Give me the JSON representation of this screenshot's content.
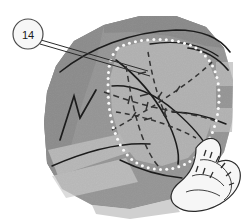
{
  "figure": {
    "type": "geological-sketch-map",
    "background_color": "#ffffff",
    "width": 242,
    "height": 223
  },
  "callout": {
    "label": "14",
    "name": "callout-marker-14",
    "circle": {
      "cx": 28,
      "cy": 34,
      "r": 15
    },
    "circle_fill": "#f7f7f7",
    "circle_stroke": "#4a4a4a",
    "leader_lines": [
      {
        "x1": 41,
        "y1": 40,
        "x2": 148,
        "y2": 71
      },
      {
        "x1": 40,
        "y1": 44,
        "x2": 150,
        "y2": 76
      }
    ],
    "leader_stroke": "#2b2b2b"
  },
  "palette": {
    "outer_massif": "#8f8f8f",
    "outer_massif_dark": "#7c7c7c",
    "slope_shadow": "#6e6e6e",
    "inner_zone": "#c9c9c9",
    "light_band": "#cfcfcf",
    "pale_band": "#d9d9d9",
    "white_lobe": "#f4f4f4",
    "lineament": "#1c1c1c",
    "dashed_fault": "#333333",
    "dot_boundary": "#fafafa",
    "hatch": "#2a2a2a"
  },
  "regions": [
    {
      "name": "outer-massif-polygon",
      "description": "Main angular rock massif body",
      "fill": "#8f8f8f",
      "points": "56,66 74,41 104,25 140,16 176,16 206,27 224,48 233,80 232,122 224,152 206,178 172,199 130,209 92,205 62,189 47,163 44,122 47,92"
    },
    {
      "name": "massif-shadow-left",
      "description": "Darker shaded left flank",
      "fill": "#7b7b7b",
      "points": "56,66 74,41 104,25 96,62 82,104 70,150 62,189 47,163 44,122 47,92"
    },
    {
      "name": "massif-shadow-top",
      "description": "Dark crest band along upper edge",
      "fill": "#777777",
      "points": "104,25 140,16 176,16 206,27 224,48 206,46 170,36 132,32 104,33"
    },
    {
      "name": "inner-light-zone",
      "description": "Light grey zone enclosed by the dotted boundary",
      "fill": "#c9c9c9",
      "points": "118,48 150,40 182,42 206,56 216,80 216,110 206,138 188,158 162,166 136,160 120,140 112,112 110,78"
    },
    {
      "name": "right-light-band-upper",
      "description": "Pale horizontal band on right flank",
      "fill": "#cdcdcd",
      "points": "216,62 233,62 233,86 216,86"
    },
    {
      "name": "right-light-band-lower",
      "description": "Second pale horizontal band on right flank",
      "fill": "#cdcdcd",
      "points": "212,108 233,108 232,132 210,132"
    },
    {
      "name": "lower-left-pale-band",
      "description": "Broad pale band crossing lower left slope",
      "fill": "#d4d4d4",
      "points": "48,150 120,134 130,152 58,176"
    },
    {
      "name": "lower-left-pale-band-2",
      "description": "Lower pale toe band",
      "fill": "#dcdcdc",
      "points": "52,176 126,158 138,182 66,198"
    },
    {
      "name": "bottom-toe-pale",
      "description": "Pale toe apron at base",
      "fill": "#d0d0d0",
      "points": "92,205 130,209 172,199 180,212 130,219 96,214"
    }
  ],
  "dotted_boundary": {
    "name": "dotted-zone-boundary",
    "description": "White dotted line delimiting the mapped inner zone",
    "dot_color": "#fafafa",
    "dot_radius": 1.5,
    "path": "M118,48 C136,38 170,36 192,46 C212,56 220,76 219,100 C218,124 210,146 192,160 C172,174 146,172 130,158 C114,142 108,114 108,86 C108,66 110,56 118,48 Z"
  },
  "lineaments": [
    {
      "name": "lineament-crest",
      "d": "M60,72 C90,48 130,32 176,30 C204,30 220,38 230,52",
      "width": 1.6
    },
    {
      "name": "lineament-upper-right",
      "d": "M150,44 C176,40 200,44 218,56",
      "width": 1.4
    },
    {
      "name": "lineament-inner-arc",
      "d": "M116,60 C132,72 152,92 166,118 C176,138 180,152 178,164",
      "width": 1.6
    },
    {
      "name": "lineament-inner-arc-2",
      "d": "M112,86 C132,84 156,94 176,112 C192,126 204,140 210,152",
      "width": 1.4
    },
    {
      "name": "lineament-v-left",
      "d": "M60,140 L74,96 L80,118 L96,90",
      "width": 1.7
    },
    {
      "name": "lineament-left-sweep",
      "d": "M52,166 C84,152 120,142 150,144",
      "width": 1.5
    },
    {
      "name": "lineament-right-band-edge",
      "d": "M188,48 C204,50 218,58 228,70",
      "width": 1.7
    },
    {
      "name": "lineament-right-lower",
      "d": "M172,112 C190,112 208,116 226,124",
      "width": 1.5
    },
    {
      "name": "lineament-toe",
      "d": "M120,160 C140,170 162,176 182,178",
      "width": 1.4
    }
  ],
  "dashed_faults": [
    {
      "name": "dashed-fault-a",
      "d": "M104,92 C126,100 152,108 178,112 C196,115 208,118 218,122",
      "dash": "6 4"
    },
    {
      "name": "dashed-fault-b",
      "d": "M126,66 C130,90 134,114 142,136 C148,152 154,162 160,168",
      "dash": "6 4"
    },
    {
      "name": "dashed-fault-c",
      "d": "M112,130 C134,118 158,104 180,88 C194,78 204,70 212,62",
      "dash": "5 4"
    },
    {
      "name": "dashed-fault-d",
      "d": "M148,52 C152,76 158,100 168,120",
      "dash": "5 4"
    },
    {
      "name": "dashed-fault-e",
      "d": "M116,112 C142,116 170,124 196,138",
      "dash": "5 4"
    }
  ],
  "fault_ticks": [
    {
      "name": "fault-tick",
      "x1": 130,
      "y1": 96,
      "x2": 128,
      "y2": 104
    },
    {
      "name": "fault-tick",
      "x1": 148,
      "y1": 102,
      "x2": 146,
      "y2": 110
    },
    {
      "name": "fault-tick",
      "x1": 166,
      "y1": 108,
      "x2": 164,
      "y2": 116
    },
    {
      "name": "fault-tick",
      "x1": 138,
      "y1": 74,
      "x2": 146,
      "y2": 72
    },
    {
      "name": "fault-tick",
      "x1": 140,
      "y1": 96,
      "x2": 148,
      "y2": 94
    },
    {
      "name": "fault-tick",
      "x1": 144,
      "y1": 120,
      "x2": 152,
      "y2": 118
    },
    {
      "name": "fault-tick",
      "x1": 158,
      "y1": 98,
      "x2": 162,
      "y2": 92
    },
    {
      "name": "fault-tick",
      "x1": 176,
      "y1": 92,
      "x2": 180,
      "y2": 86
    },
    {
      "name": "fault-tick",
      "x1": 132,
      "y1": 118,
      "x2": 136,
      "y2": 112
    }
  ],
  "white_lobe": {
    "name": "white-tongue-feature",
    "description": "White lobate tongue / scarp feature with hatch ornament in lower right",
    "fill": "#f6f6f6",
    "stroke": "#2a2a2a",
    "outline": "M196,148 C202,140 210,136 216,140 C222,144 222,154 218,162 C228,158 238,162 240,172 C242,184 234,196 220,204 C204,213 186,214 176,206 C168,200 170,190 180,182 C190,174 196,164 196,148 Z",
    "inner_lines": [
      "M200,160 C210,158 222,164 228,174 C234,184 232,194 224,200",
      "M192,176 C202,172 216,176 224,186",
      "M186,192 C196,188 210,190 220,196"
    ],
    "hatch_marks": [
      {
        "x1": 204,
        "y1": 156,
        "x2": 206,
        "y2": 150
      },
      {
        "x1": 210,
        "y1": 158,
        "x2": 212,
        "y2": 152
      },
      {
        "x1": 216,
        "y1": 162,
        "x2": 219,
        "y2": 156
      },
      {
        "x1": 221,
        "y1": 168,
        "x2": 225,
        "y2": 163
      },
      {
        "x1": 226,
        "y1": 176,
        "x2": 231,
        "y2": 172
      },
      {
        "x1": 229,
        "y1": 185,
        "x2": 234,
        "y2": 183
      },
      {
        "x1": 196,
        "y1": 172,
        "x2": 198,
        "y2": 166
      },
      {
        "x1": 203,
        "y1": 174,
        "x2": 205,
        "y2": 168
      },
      {
        "x1": 210,
        "y1": 178,
        "x2": 213,
        "y2": 172
      }
    ]
  }
}
